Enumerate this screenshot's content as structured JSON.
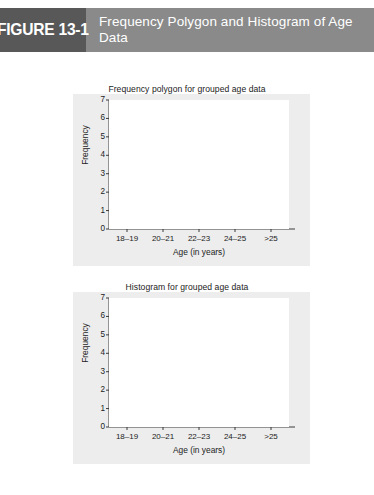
{
  "header": {
    "figure_tag": "FIGURE 13-1",
    "title": "Frequency Polygon and Histogram of Age Data",
    "tag_bg": "#585858",
    "banner_bg": "#8a8a8a",
    "text_color": "#ffffff"
  },
  "panel_bg": "#ededed",
  "plot_bg": "#ffffff",
  "chart_data": [
    {
      "type": "line",
      "title": "Frequency polygon for grouped age data",
      "xlabel": "Age (in years)",
      "ylabel": "Frequency",
      "categories": [
        "18–19",
        "20–21",
        "22–23",
        "24–25",
        ">25"
      ],
      "values": [
        6,
        6,
        5,
        1,
        2
      ],
      "yticks": [
        0,
        1,
        2,
        3,
        4,
        5,
        6,
        7
      ],
      "ylim": [
        0,
        7
      ],
      "grid": false,
      "legend": "none",
      "marker": "circle",
      "line_color": "#111111"
    },
    {
      "type": "bar",
      "title": "Histogram for grouped age data",
      "xlabel": "Age (in years)",
      "ylabel": "Frequency",
      "categories": [
        "18–19",
        "20–21",
        "22–23",
        "24–25",
        ">25"
      ],
      "values": [
        6,
        6,
        5,
        1,
        2
      ],
      "yticks": [
        0,
        1,
        2,
        3,
        4,
        5,
        6,
        7
      ],
      "ylim": [
        0,
        7
      ],
      "grid": false,
      "legend": "none",
      "bar_color": "#9b9b9b"
    }
  ]
}
